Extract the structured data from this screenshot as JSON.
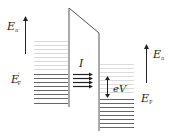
{
  "diagram": {
    "labels": {
      "left_energy": "E",
      "left_energy_sub": "n'",
      "left_fermi": "E",
      "left_fermi_sup": "'",
      "left_fermi_sub": "F",
      "current": "I",
      "bias": "eV",
      "right_energy": "E",
      "right_energy_sub": "n",
      "right_fermi": "E",
      "right_fermi_sub": "F"
    },
    "colors": {
      "line": "#555555",
      "filled_level": "#666666",
      "empty_level": "#d8d8d8",
      "arrow": "#222222"
    }
  }
}
